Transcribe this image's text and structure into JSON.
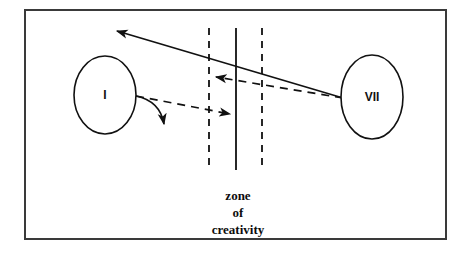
{
  "figure": {
    "type": "concept-diagram",
    "background_color": "#ffffff",
    "stroke_color": "#111111",
    "border": {
      "name": "figure-border",
      "x": 24,
      "y": 9,
      "width": 423,
      "height": 231,
      "stroke_width": 2,
      "color": "#333333"
    }
  },
  "nodes": [
    {
      "id": "node-1",
      "label": "I",
      "shape": "ellipse",
      "cx": 105,
      "cy": 95,
      "rx": 31,
      "ry": 39,
      "stroke": "#111111",
      "fill": "#ffffff"
    },
    {
      "id": "node-7",
      "label": "VII",
      "shape": "ellipse",
      "cx": 372,
      "cy": 97,
      "rx": 31,
      "ry": 42,
      "stroke": "#111111",
      "fill": "#ffffff"
    }
  ],
  "zone": {
    "name": "zone-of-creativity",
    "caption_lines": [
      "zone",
      "of",
      "creativity"
    ],
    "caption_center_x": 238,
    "caption_top_y": 196,
    "line_top_y": 28,
    "line_bottom_y": 170,
    "boundaries": [
      {
        "id": "zone-left-boundary",
        "x": 209,
        "style": "dashed"
      },
      {
        "id": "zone-center-line",
        "x": 236,
        "style": "solid"
      },
      {
        "id": "zone-right-boundary",
        "x": 262,
        "style": "dashed"
      }
    ]
  },
  "connectors": [
    {
      "id": "solid-arrow-vii-to-left",
      "style": "solid",
      "from": {
        "x": 343,
        "y": 98
      },
      "to": {
        "x": 113,
        "y": 29
      },
      "arrowhead": "to",
      "description": "long solid arrow from node VII across the zone pointing upper-left"
    },
    {
      "id": "dashed-arrow-vii-to-zone",
      "style": "dashed",
      "from": {
        "x": 343,
        "y": 98
      },
      "to": {
        "x": 212,
        "y": 77
      },
      "arrowhead": "to",
      "description": "dashed arrow from node VII pointing left into the zone of creativity"
    },
    {
      "id": "dashed-arrow-i-to-zone",
      "style": "dashed",
      "from": {
        "x": 136,
        "y": 96
      },
      "to": {
        "x": 234,
        "y": 116
      },
      "arrowhead": "to",
      "description": "dashed arrow from node I pointing right into the zone of creativity"
    },
    {
      "id": "curved-arrow-i-down",
      "style": "solid-curved",
      "from": {
        "x": 136,
        "y": 96
      },
      "control": {
        "x": 160,
        "y": 102
      },
      "to": {
        "x": 167,
        "y": 128
      },
      "arrowhead": "to",
      "description": "short curved solid arrow leaving node I and bending downward"
    }
  ]
}
